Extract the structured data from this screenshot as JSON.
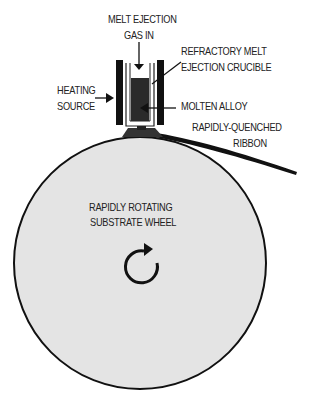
{
  "diagram": {
    "labels": {
      "gas_in_line1": "MELT EJECTION",
      "gas_in_line2": "GAS IN",
      "crucible_line1": "REFRACTORY MELT",
      "crucible_line2": "EJECTION CRUCIBLE",
      "heating_line1": "HEATING",
      "heating_line2": "SOURCE",
      "molten_alloy": "MOLTEN ALLOY",
      "ribbon_line1": "RAPIDLY-QUENCHED",
      "ribbon_line2": "RIBBON",
      "wheel_line1": "RAPIDLY ROTATING",
      "wheel_line2": "SUBSTRATE WHEEL"
    },
    "colors": {
      "wheel_fill": "#e4e4e4",
      "outline": "#111111",
      "alloy": "#2a2a2a",
      "background": "#ffffff"
    },
    "icons": [
      "down-arrow-icon",
      "right-arrow-icon",
      "left-arrow-icon",
      "clockwise-rotation-icon"
    ]
  }
}
